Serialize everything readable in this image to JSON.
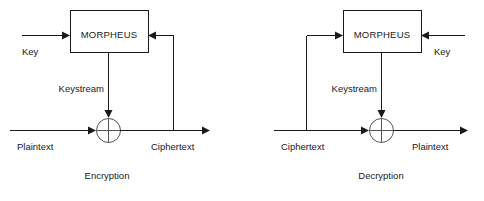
{
  "page": {
    "background_color": "#ffffff",
    "line_color": "#1a1a1a",
    "xor_color": "#555555",
    "width": 484,
    "height": 201
  },
  "diagrams": [
    {
      "id": "encryption",
      "caption": "Encryption",
      "cipher_block_label": "MORPHEUS",
      "labels": {
        "key": "Key",
        "keystream": "Keystream",
        "data_in": "Plaintext",
        "data_out": "Ciphertext"
      },
      "flow": {
        "key_input_side": "left",
        "feedback_source": "Ciphertext",
        "feedback_target_side": "right",
        "combiner": "xor"
      }
    },
    {
      "id": "decryption",
      "caption": "Decryption",
      "cipher_block_label": "MORPHEUS",
      "labels": {
        "key": "Key",
        "keystream": "Keystream",
        "data_in": "Ciphertext",
        "data_out": "Plaintext"
      },
      "flow": {
        "key_input_side": "right",
        "feedback_source": "Ciphertext",
        "feedback_target_side": "left",
        "combiner": "xor"
      }
    }
  ]
}
